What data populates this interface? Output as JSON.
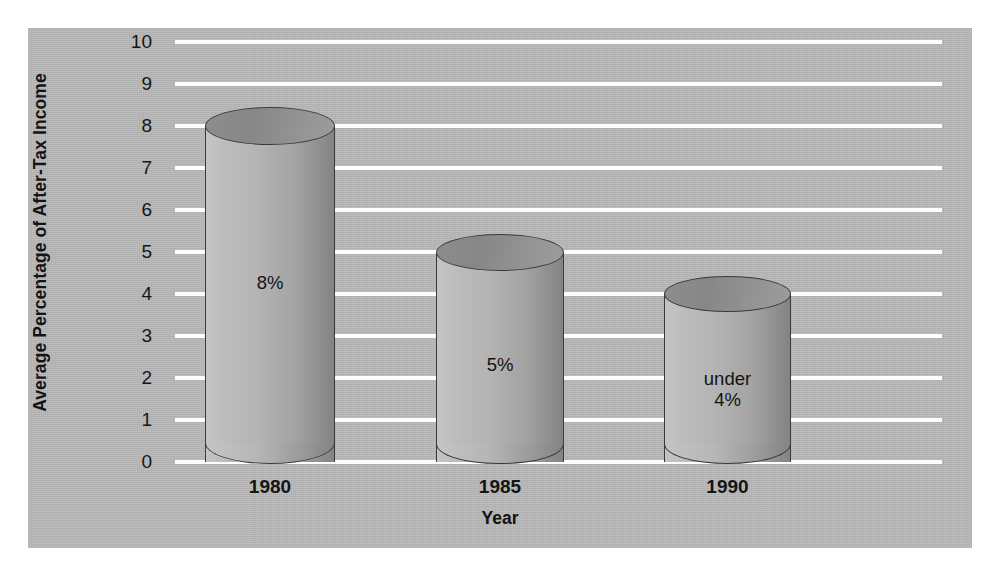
{
  "chart_data": {
    "type": "bar",
    "title": "",
    "subtitle": "",
    "xlabel": "Year",
    "ylabel": "Average Percentage of After-Tax Income",
    "categories": [
      "1980",
      "1985",
      "1990"
    ],
    "values": [
      8,
      5,
      4
    ],
    "data_labels": [
      "8%",
      "5%",
      "under\n4%"
    ],
    "bar_labels": [
      {
        "line1": "8%",
        "line2": ""
      },
      {
        "line1": "5%",
        "line2": ""
      },
      {
        "line1": "under",
        "line2": "4%"
      }
    ],
    "ylim": [
      0,
      10
    ],
    "yticks": [
      "10",
      "9",
      "8",
      "7",
      "6",
      "5",
      "4",
      "3",
      "2",
      "1",
      "0"
    ],
    "ytick_values": [
      10,
      9,
      8,
      7,
      6,
      5,
      4,
      3,
      2,
      1,
      0
    ],
    "grid": true,
    "grid_color": "#ffffff",
    "legend": "none",
    "style": "3d-cylinder",
    "panel_color": "#b9b9b9",
    "bar_color": "#b4b4b4",
    "bar_edge_color": "#3a3a3a",
    "text_color": "#141414"
  }
}
